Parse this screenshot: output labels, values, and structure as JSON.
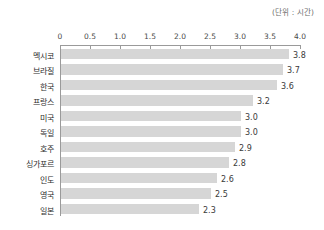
{
  "unit_note": "(단위 : 시간)",
  "chart_data": {
    "type": "bar",
    "orientation": "horizontal",
    "title": "",
    "subtitle": "",
    "xlabel": "",
    "ylabel": "",
    "unit_label": "(단위 : 시간)",
    "xlim": [
      0,
      4.0
    ],
    "xticks": [
      "0",
      "0.5",
      "1.0",
      "1.5",
      "2.0",
      "2.5",
      "3.0",
      "3.5",
      "4.0"
    ],
    "xtick_values": [
      0,
      0.5,
      1.0,
      1.5,
      2.0,
      2.5,
      3.0,
      3.5,
      4.0
    ],
    "grid": false,
    "legend": null,
    "bar_color": "#d6d6d6",
    "axis_color": "#9a9a9a",
    "categories": [
      "멕시코",
      "브라질",
      "한국",
      "프랑스",
      "미국",
      "독일",
      "호주",
      "싱가포르",
      "인도",
      "영국",
      "일본"
    ],
    "values": [
      3.8,
      3.7,
      3.6,
      3.2,
      3.0,
      3.0,
      2.9,
      2.8,
      2.6,
      2.5,
      2.3
    ],
    "value_labels": [
      "3.8",
      "3.7",
      "3.6",
      "3.2",
      "3.0",
      "3.0",
      "2.9",
      "2.8",
      "2.6",
      "2.5",
      "2.3"
    ],
    "rows": [
      {
        "category": "멕시코",
        "value": 3.8,
        "label": "3.8"
      },
      {
        "category": "브라질",
        "value": 3.7,
        "label": "3.7"
      },
      {
        "category": "한국",
        "value": 3.6,
        "label": "3.6"
      },
      {
        "category": "프랑스",
        "value": 3.2,
        "label": "3.2"
      },
      {
        "category": "미국",
        "value": 3.0,
        "label": "3.0"
      },
      {
        "category": "독일",
        "value": 3.0,
        "label": "3.0"
      },
      {
        "category": "호주",
        "value": 2.9,
        "label": "2.9"
      },
      {
        "category": "싱가포르",
        "value": 2.8,
        "label": "2.8"
      },
      {
        "category": "인도",
        "value": 2.6,
        "label": "2.6"
      },
      {
        "category": "영국",
        "value": 2.5,
        "label": "2.5"
      },
      {
        "category": "일본",
        "value": 2.3,
        "label": "2.3"
      }
    ]
  }
}
